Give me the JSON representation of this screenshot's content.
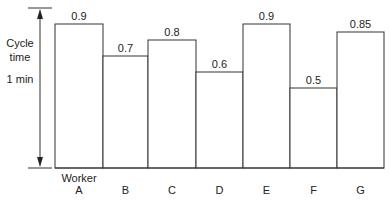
{
  "chart_data": {
    "type": "bar",
    "title": "",
    "xlabel": "Worker",
    "ylabel": "Cycle time",
    "ylabel_lines": [
      "Cycle",
      "time"
    ],
    "y_reference_label": "1 min",
    "categories": [
      "A",
      "B",
      "C",
      "D",
      "E",
      "F",
      "G"
    ],
    "values": [
      0.9,
      0.7,
      0.8,
      0.6,
      0.9,
      0.5,
      0.85
    ],
    "value_labels": [
      "0.9",
      "0.7",
      "0.8",
      "0.6",
      "0.9",
      "0.5",
      "0.85"
    ],
    "ylim": [
      0,
      1
    ],
    "grid": false,
    "legend": null,
    "bar_fill": "#ffffff",
    "bar_stroke": "#333333"
  }
}
